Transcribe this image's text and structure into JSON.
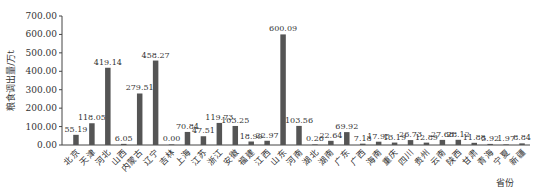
{
  "chart_data": {
    "type": "bar",
    "title": "",
    "xlabel": "省份",
    "ylabel": "粮食调出量/万t",
    "ylim": [
      0,
      700
    ],
    "yticks": [
      "0.00",
      "100.00",
      "200.00",
      "300.00",
      "400.00",
      "500.00",
      "600.00",
      "700.00"
    ],
    "grid": false,
    "legend": null,
    "bar_color": "#555555",
    "categories": [
      "北京",
      "天津",
      "河北",
      "山西",
      "内蒙古",
      "辽宁",
      "吉林",
      "上海",
      "江苏",
      "浙江",
      "安徽",
      "福建",
      "江西",
      "山东",
      "河南",
      "湖北",
      "湖南",
      "广东",
      "广西",
      "海南",
      "重庆",
      "四川",
      "贵州",
      "云南",
      "陕西",
      "甘肃",
      "青海",
      "宁夏",
      "新疆"
    ],
    "values": [
      55.19,
      118.05,
      419.14,
      6.05,
      279.51,
      458.27,
      0.0,
      70.84,
      47.51,
      119.73,
      103.25,
      18.99,
      22.97,
      600.09,
      103.56,
      0.26,
      22.64,
      69.92,
      7.18,
      17.95,
      13.19,
      26.73,
      12.89,
      27.68,
      28.12,
      11.88,
      5.92,
      1.97,
      8.84
    ],
    "labels": [
      "55.19",
      "118.05",
      "419.14",
      "6.05",
      "279.51",
      "458.27",
      "0.00",
      "70.84",
      "47.51",
      "119.73",
      "103.25",
      "18.99",
      "22.97",
      "600.09",
      "103.56",
      "0.26",
      "22.64",
      "69.92",
      "7.18",
      "17.95",
      "13.19",
      "26.73",
      "12.89",
      "27.68",
      "28.12",
      "11.88",
      "5.92",
      "1.97",
      "8.84"
    ]
  }
}
